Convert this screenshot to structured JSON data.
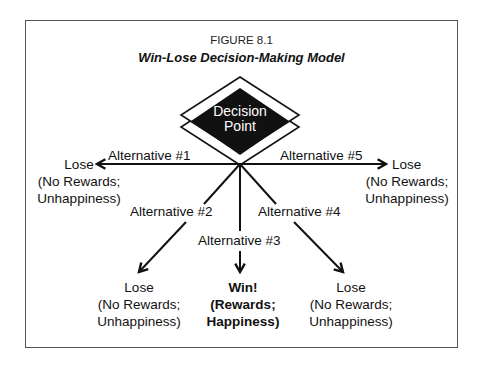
{
  "figure": {
    "number": "FIGURE 8.1",
    "title": "Win-Lose Decision-Making Model"
  },
  "decision_node": {
    "line1": "Decision",
    "line2": "Point"
  },
  "alternatives": [
    {
      "label": "Alternative #1",
      "direction": "left"
    },
    {
      "label": "Alternative #2",
      "direction": "down-left"
    },
    {
      "label": "Alternative #3",
      "direction": "down"
    },
    {
      "label": "Alternative #4",
      "direction": "down-right"
    },
    {
      "label": "Alternative #5",
      "direction": "right"
    }
  ],
  "outcomes": [
    {
      "alt": 1,
      "result": "Lose",
      "line2": "(No Rewards;",
      "line3": "Unhappiness)"
    },
    {
      "alt": 2,
      "result": "Lose",
      "line2": "(No Rewards;",
      "line3": "Unhappiness)"
    },
    {
      "alt": 3,
      "result": "Win!",
      "line2": "(Rewards;",
      "line3": "Happiness)"
    },
    {
      "alt": 4,
      "result": "Lose",
      "line2": "(No Rewards;",
      "line3": "Unhappiness)"
    },
    {
      "alt": 5,
      "result": "Lose",
      "line2": "(No Rewards;",
      "line3": "Unhappiness)"
    }
  ],
  "colors": {
    "line": "#111111",
    "node_fill": "#111111",
    "frame": "#555555"
  }
}
